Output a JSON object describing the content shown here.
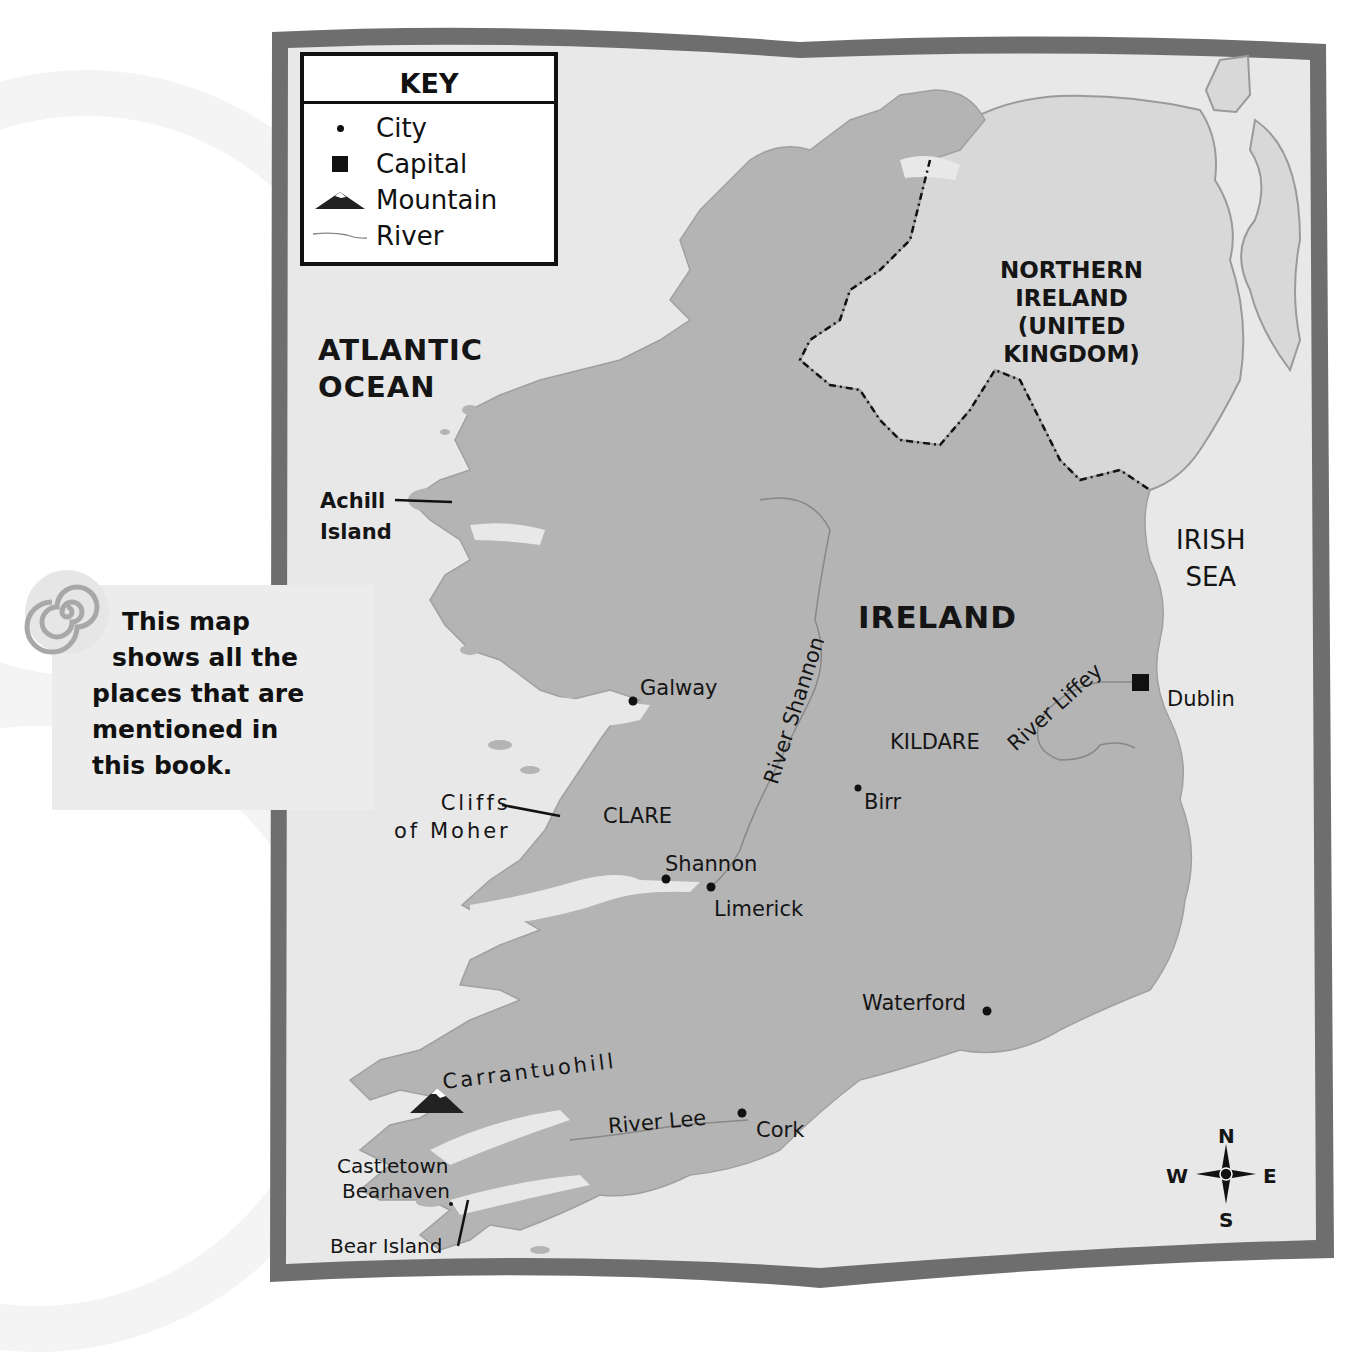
{
  "key": {
    "title": "KEY",
    "items": [
      {
        "symbol": "city-dot",
        "label": "City"
      },
      {
        "symbol": "capital-square",
        "label": "Capital"
      },
      {
        "symbol": "mountain-icon",
        "label": "Mountain"
      },
      {
        "symbol": "river-line",
        "label": "River"
      }
    ]
  },
  "note": {
    "lines": [
      "This map",
      "shows all the",
      "places that are",
      "mentioned in",
      "this book."
    ]
  },
  "regions": {
    "ocean": [
      "ATLANTIC",
      "OCEAN"
    ],
    "sea": [
      "IRISH",
      "SEA"
    ],
    "country": "IRELAND",
    "northern_ireland": [
      "NORTHERN",
      "IRELAND",
      "(UNITED",
      "KINGDOM)"
    ],
    "counties": {
      "clare": "CLARE",
      "kildare": "KILDARE"
    }
  },
  "places": {
    "achill": [
      "Achill",
      "Island"
    ],
    "cliffs": [
      "Cliffs",
      "of Moher"
    ],
    "galway": "Galway",
    "shannon": "Shannon",
    "limerick": "Limerick",
    "birr": "Birr",
    "dublin": "Dublin",
    "waterford": "Waterford",
    "cork": "Cork",
    "carrantuohill": "Carrantuohill",
    "castletown": [
      "Castletown",
      "Bearhaven"
    ],
    "bear_island": "Bear Island"
  },
  "rivers": {
    "shannon": "River Shannon",
    "liffey": "River Liffey",
    "lee": "River Lee"
  },
  "compass": {
    "n": "N",
    "s": "S",
    "e": "E",
    "w": "W"
  },
  "colors": {
    "land": "#b4b4b4",
    "northern_ireland": "#d8d8d8",
    "sea": "#e8e8e8",
    "frame": "#6e6e6e",
    "text": "#151515"
  }
}
